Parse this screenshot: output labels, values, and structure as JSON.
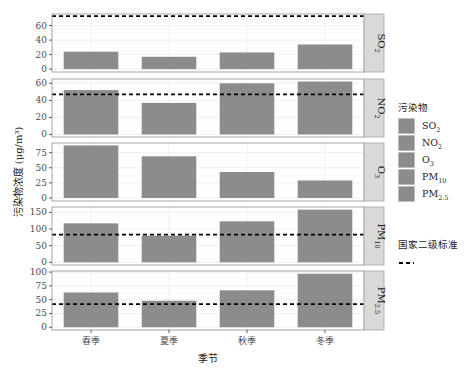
{
  "chart_data": {
    "type": "bar",
    "facet": "rows",
    "xlabel": "季节",
    "ylabel": "污染物浓度 (μg/m³)",
    "categories": [
      "春季",
      "夏季",
      "秋季",
      "冬季"
    ],
    "bar_color": "#8c8c8c",
    "panels": [
      {
        "name": "SO2",
        "label_main": "SO",
        "label_sub": "2",
        "values": [
          24,
          17,
          23,
          34
        ],
        "standard": 73,
        "ylim": [
          -4,
          76
        ],
        "ticks": [
          0,
          20,
          40,
          60
        ]
      },
      {
        "name": "NO2",
        "label_main": "NO",
        "label_sub": "2",
        "values": [
          52,
          37,
          60,
          62
        ],
        "standard": 47,
        "ylim": [
          -3,
          65
        ],
        "ticks": [
          0,
          20,
          40,
          60
        ]
      },
      {
        "name": "O3",
        "label_main": "O",
        "label_sub": "3",
        "values": [
          87,
          69,
          43,
          29
        ],
        "standard": null,
        "ylim": [
          -5,
          91
        ],
        "ticks": [
          0,
          25,
          50,
          75
        ]
      },
      {
        "name": "PM10",
        "label_main": "PM",
        "label_sub": "10",
        "values": [
          117,
          80,
          123,
          158
        ],
        "standard": 83,
        "ylim": [
          -8,
          166
        ],
        "ticks": [
          0,
          50,
          100,
          150
        ]
      },
      {
        "name": "PM2.5",
        "label_main": "PM",
        "label_sub": "2.5",
        "values": [
          63,
          48,
          67,
          97
        ],
        "standard": 42,
        "ylim": [
          -5,
          102
        ],
        "ticks": [
          0,
          25,
          50,
          75,
          100
        ]
      }
    ],
    "legend": {
      "fill_title": "污染物",
      "fill_items": [
        {
          "main": "SO",
          "sub": "2"
        },
        {
          "main": "NO",
          "sub": "2"
        },
        {
          "main": "O",
          "sub": "3"
        },
        {
          "main": "PM",
          "sub": "10"
        },
        {
          "main": "PM",
          "sub": "2.5"
        }
      ],
      "line_title": "国家二级标准",
      "position": "right"
    },
    "grid": true
  }
}
